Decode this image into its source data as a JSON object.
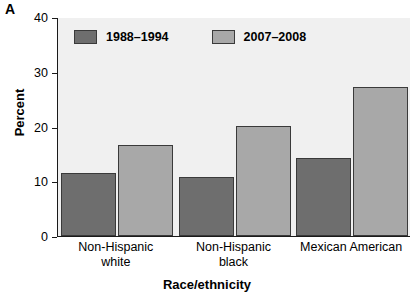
{
  "panel": {
    "letter": "A"
  },
  "chart_data": {
    "type": "bar",
    "title": "",
    "subtitle": "",
    "xlabel": "Race/ethnicity",
    "ylabel": "Percent",
    "ylim": [
      0,
      40
    ],
    "yticks": [
      0,
      10,
      20,
      30,
      40
    ],
    "ytick_labels": [
      "0",
      "10",
      "20",
      "30",
      "40"
    ],
    "grid": false,
    "legend_position": "top-left-inside",
    "categories": [
      "Non-Hispanic white",
      "Non-Hispanic black",
      "Mexican American"
    ],
    "category_lines": [
      [
        "Non-Hispanic",
        "white"
      ],
      [
        "Non-Hispanic",
        "black"
      ],
      [
        "Mexican American",
        ""
      ]
    ],
    "series": [
      {
        "name": "1988–1994",
        "color": "#6e6e6e",
        "values": [
          11.5,
          10.8,
          14.2
        ]
      },
      {
        "name": "2007–2008",
        "color": "#a8a8a8",
        "values": [
          16.6,
          20.1,
          27.2
        ]
      }
    ]
  },
  "colors": {
    "series_1988_1994": "#6e6e6e",
    "series_2007_2008": "#a8a8a8",
    "plot_background": "#f0f0f0",
    "axis": "#1a1a1a",
    "bar_border": "#3a3a3a",
    "figure_background": "#ffffff"
  }
}
